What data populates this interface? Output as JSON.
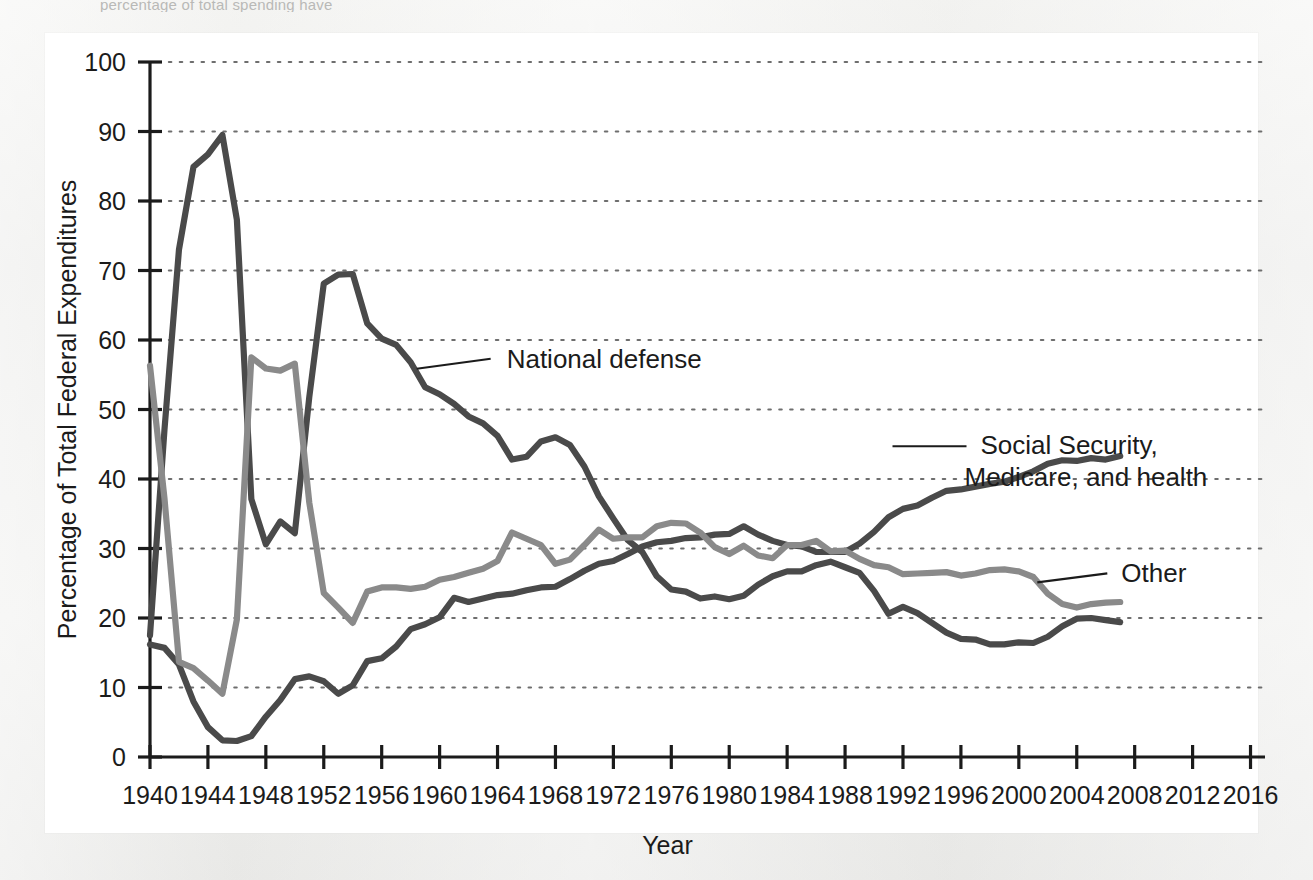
{
  "page": {
    "top_caption_partial": "percentage of total spending have",
    "background_color": "#ececeb",
    "card_color": "#ffffff"
  },
  "chart_data": {
    "type": "line",
    "title": "",
    "xlabel": "Year",
    "ylabel": "Percentage of Total Federal Expenditures",
    "xlim": [
      1940,
      2017
    ],
    "ylim": [
      0,
      100
    ],
    "ytick_step": 10,
    "xtick_step": 4,
    "grid": "horizontal-dotted",
    "legend_position": "inline-annotations",
    "xticks": [
      "1940",
      "1944",
      "1948",
      "1952",
      "1956",
      "1960",
      "1964",
      "1968",
      "1972",
      "1976",
      "1980",
      "1984",
      "1988",
      "1992",
      "1996",
      "2000",
      "2004",
      "2008",
      "2012",
      "2016"
    ],
    "yticks": [
      "0",
      "10",
      "20",
      "30",
      "40",
      "50",
      "60",
      "70",
      "80",
      "90",
      "100"
    ],
    "x": [
      1940,
      1941,
      1942,
      1943,
      1944,
      1945,
      1946,
      1947,
      1948,
      1949,
      1950,
      1951,
      1952,
      1953,
      1954,
      1955,
      1956,
      1957,
      1958,
      1959,
      1960,
      1961,
      1962,
      1963,
      1964,
      1965,
      1966,
      1967,
      1968,
      1969,
      1970,
      1971,
      1972,
      1973,
      1974,
      1975,
      1976,
      1977,
      1978,
      1979,
      1980,
      1981,
      1982,
      1983,
      1984,
      1985,
      1986,
      1987,
      1988,
      1989,
      1990,
      1991,
      1992,
      1993,
      1994,
      1995,
      1996,
      1997,
      1998,
      1999,
      2000,
      2001,
      2002,
      2003,
      2004,
      2005,
      2006,
      2007
    ],
    "series": [
      {
        "name": "National defense",
        "color": "#4a4a4a",
        "label_anchor_year": 1958,
        "label_anchor_value": 55,
        "values": [
          17.5,
          47.1,
          73.0,
          84.9,
          86.7,
          89.5,
          77.3,
          37.1,
          30.6,
          33.9,
          32.2,
          51.8,
          68.1,
          69.4,
          69.5,
          62.4,
          60.2,
          59.3,
          56.8,
          53.2,
          52.2,
          50.8,
          49.0,
          48.0,
          46.2,
          42.8,
          43.2,
          45.4,
          46.0,
          44.9,
          41.8,
          37.5,
          34.3,
          31.2,
          29.5,
          26.0,
          24.1,
          23.8,
          22.8,
          23.1,
          22.7,
          23.2,
          24.8,
          26.0,
          26.7,
          26.7,
          27.6,
          28.1,
          27.3,
          26.5,
          23.9,
          20.6,
          21.6,
          20.7,
          19.3,
          17.9,
          17.0,
          16.9,
          16.2,
          16.2,
          16.5,
          16.4,
          17.3,
          18.8,
          19.9,
          20.0,
          19.7,
          19.4
        ]
      },
      {
        "name": "Social Security, Medicare, and health",
        "color": "#4a4a4a",
        "label_anchor_year": 1991,
        "label_anchor_value": 45,
        "values": [
          16.2,
          15.7,
          13.3,
          8.0,
          4.3,
          2.4,
          2.3,
          3.0,
          5.8,
          8.2,
          11.2,
          11.6,
          10.9,
          9.1,
          10.3,
          13.8,
          14.2,
          15.9,
          18.4,
          19.1,
          20.1,
          22.9,
          22.3,
          22.8,
          23.3,
          23.5,
          24.0,
          24.4,
          24.5,
          25.6,
          26.8,
          27.8,
          28.2,
          29.2,
          30.3,
          30.9,
          31.1,
          31.5,
          31.6,
          32.0,
          32.1,
          33.2,
          32.0,
          31.1,
          30.5,
          30.3,
          29.5,
          29.5,
          29.5,
          30.7,
          32.4,
          34.5,
          35.7,
          36.2,
          37.3,
          38.3,
          38.5,
          38.9,
          39.3,
          39.6,
          40.3,
          41.1,
          42.2,
          42.7,
          42.6,
          43.0,
          42.8,
          43.3
        ]
      },
      {
        "name": "Other",
        "color": "#8a8a8a",
        "label_anchor_year": 2001,
        "label_anchor_value": 26,
        "values": [
          56.3,
          37.2,
          13.7,
          12.8,
          11.0,
          9.1,
          19.8,
          57.5,
          55.9,
          55.6,
          56.6,
          36.6,
          23.6,
          21.5,
          19.3,
          23.8,
          24.4,
          24.4,
          24.2,
          24.5,
          25.5,
          25.9,
          26.5,
          27.1,
          28.2,
          32.3,
          31.4,
          30.5,
          27.8,
          28.4,
          30.5,
          32.7,
          31.4,
          31.6,
          31.6,
          33.2,
          33.7,
          33.6,
          32.3,
          30.2,
          29.2,
          30.4,
          29.0,
          28.6,
          30.5,
          30.5,
          31.1,
          29.6,
          29.7,
          28.5,
          27.6,
          27.3,
          26.3,
          26.4,
          26.5,
          26.6,
          26.1,
          26.4,
          26.9,
          27.0,
          26.7,
          25.9,
          23.5,
          22.0,
          21.5,
          22.0,
          22.2,
          22.3
        ]
      }
    ]
  },
  "annotations": [
    {
      "name": "national-defense",
      "text": "National defense"
    },
    {
      "name": "social-security",
      "line1": "Social Security,",
      "line2": "Medicare, and health"
    },
    {
      "name": "other",
      "text": "Other"
    }
  ],
  "colors": {
    "dark_series": "#4a4a4a",
    "light_series": "#8a8a8a",
    "axis": "#1b1b1b",
    "grid": "#6e6e6e",
    "text": "#1b1b1b"
  }
}
